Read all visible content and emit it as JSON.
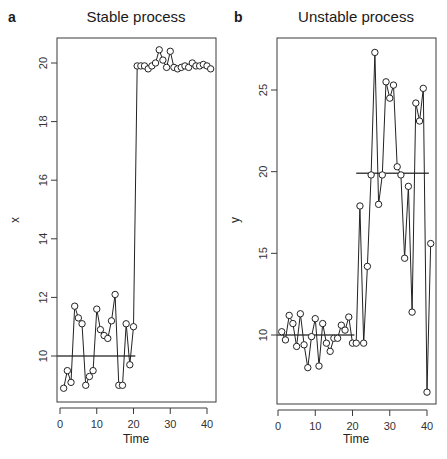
{
  "chart_data": [
    {
      "type": "line",
      "panel_letter": "a",
      "title": "Stable process",
      "xlabel": "Time",
      "ylabel": "x",
      "xlim": [
        0,
        41
      ],
      "ylim": [
        8.4,
        20.8
      ],
      "xticks": [
        0,
        10,
        20,
        30,
        40
      ],
      "yticks": [
        10,
        12,
        14,
        16,
        18,
        20
      ],
      "grid": false,
      "markers": "open-circle",
      "x": [
        1,
        2,
        3,
        4,
        5,
        6,
        7,
        8,
        9,
        10,
        11,
        12,
        13,
        14,
        15,
        16,
        17,
        18,
        19,
        20,
        21,
        22,
        23,
        24,
        25,
        26,
        27,
        28,
        29,
        30,
        31,
        32,
        33,
        34,
        35,
        36,
        37,
        38,
        39,
        40,
        41
      ],
      "values": [
        8.9,
        9.5,
        9.1,
        11.7,
        11.3,
        11.1,
        9.0,
        9.3,
        9.5,
        11.6,
        10.9,
        10.7,
        10.6,
        11.2,
        12.1,
        9.0,
        9.0,
        11.1,
        9.7,
        11.0,
        19.9,
        19.9,
        19.9,
        19.8,
        19.9,
        20.0,
        20.45,
        20.1,
        19.85,
        20.4,
        19.85,
        19.8,
        19.85,
        19.9,
        19.85,
        20.0,
        19.9,
        19.9,
        19.95,
        19.9,
        19.8
      ],
      "mean_lines": [
        {
          "label": "mean (t 1-20)",
          "x_start": 0,
          "x_end": 20.5,
          "value": 10.0
        }
      ]
    },
    {
      "type": "line",
      "panel_letter": "b",
      "title": "Unstable process",
      "xlabel": "Time",
      "ylabel": "y",
      "xlim": [
        0,
        41
      ],
      "ylim": [
        5.8,
        28.4
      ],
      "xticks": [
        0,
        10,
        20,
        30,
        40
      ],
      "yticks": [
        10,
        15,
        20,
        25
      ],
      "grid": false,
      "markers": "open-circle",
      "x": [
        1,
        2,
        3,
        4,
        5,
        6,
        7,
        8,
        9,
        10,
        11,
        12,
        13,
        14,
        15,
        16,
        17,
        18,
        19,
        20,
        21,
        22,
        23,
        24,
        25,
        26,
        27,
        28,
        29,
        30,
        31,
        32,
        33,
        34,
        35,
        36,
        37,
        38,
        39,
        40,
        41
      ],
      "values": [
        10.2,
        9.7,
        11.2,
        10.7,
        9.3,
        11.3,
        9.4,
        8.0,
        9.9,
        11.0,
        8.1,
        10.7,
        9.5,
        9.0,
        9.8,
        9.8,
        10.6,
        10.3,
        11.1,
        9.5,
        9.5,
        17.9,
        9.5,
        14.2,
        19.8,
        27.3,
        18.0,
        19.8,
        25.5,
        24.5,
        25.3,
        20.3,
        19.8,
        14.7,
        19.1,
        11.4,
        24.2,
        23.1,
        25.1,
        6.5,
        15.6
      ],
      "mean_lines": [
        {
          "label": "mean (t 1-20)",
          "x_start": 0,
          "x_end": 20.5,
          "value": 10.0
        },
        {
          "label": "mean (t 21-41)",
          "x_start": 21,
          "x_end": 40.5,
          "value": 19.9
        }
      ]
    }
  ],
  "panels": [
    {
      "letter": "a",
      "title": "Stable process",
      "xlabel": "Time",
      "ylabel": "x",
      "xtick_labels": [
        "0",
        "10",
        "20",
        "30",
        "40"
      ],
      "ytick_labels": [
        "10",
        "12",
        "14",
        "16",
        "18",
        "20"
      ]
    },
    {
      "letter": "b",
      "title": "Unstable process",
      "xlabel": "Time",
      "ylabel": "y",
      "xtick_labels": [
        "0",
        "10",
        "20",
        "30",
        "40"
      ],
      "ytick_labels": [
        "10",
        "15",
        "20",
        "25"
      ]
    }
  ],
  "colors": {
    "line": "#222222",
    "axis": "#3a3a3a",
    "mean_line": "#444444",
    "background": "#ffffff"
  }
}
